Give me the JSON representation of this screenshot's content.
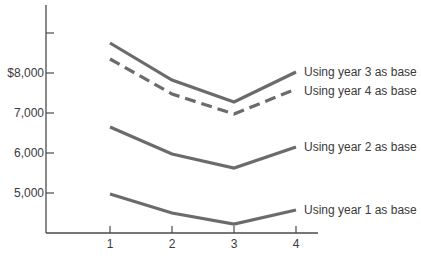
{
  "chart_data": {
    "type": "line",
    "title": "",
    "xlabel": "",
    "ylabel": "",
    "x": [
      1,
      2,
      3,
      4
    ],
    "x_tick_labels": [
      "1",
      "2",
      "3",
      "4"
    ],
    "y_ticks": [
      5000,
      6000,
      7000,
      8000,
      9000
    ],
    "y_tick_labels": [
      "5,000",
      "6,000",
      "7,000",
      "$8,000",
      ""
    ],
    "ylim": [
      4000,
      9700
    ],
    "xlim": [
      0,
      4.5
    ],
    "grid": false,
    "legend_position": "inline-right",
    "series": [
      {
        "name": "Using year 3 as base",
        "style": "solid",
        "values": [
          8750,
          7825,
          7275,
          8025
        ]
      },
      {
        "name": "Using year 4 as base",
        "style": "dashed",
        "values": [
          8350,
          7475,
          6975,
          7600
        ]
      },
      {
        "name": "Using year 2 as base",
        "style": "solid",
        "values": [
          6650,
          5975,
          5625,
          6150
        ]
      },
      {
        "name": "Using year 1 as base",
        "style": "solid",
        "values": [
          4975,
          4500,
          4225,
          4575
        ]
      }
    ],
    "colors": {
      "line": "#6b6b6b",
      "axis": "#4a4a4a",
      "text": "#3a3a3a"
    }
  }
}
